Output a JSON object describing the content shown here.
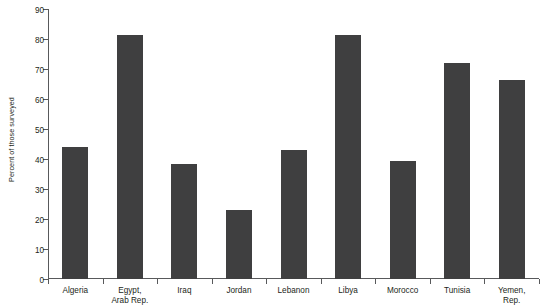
{
  "chart_data": {
    "type": "bar",
    "title": "",
    "subtitle": "",
    "xlabel": "",
    "ylabel": "Percent of those surveyed",
    "ylim": [
      0,
      90
    ],
    "ytick_step": 10,
    "yticks": [
      "90",
      "80",
      "70",
      "60",
      "50",
      "40",
      "30",
      "20",
      "10",
      "0"
    ],
    "ytick_values": [
      90,
      80,
      70,
      60,
      50,
      40,
      30,
      20,
      10,
      0
    ],
    "grid": false,
    "legend": null,
    "bar_color": "#3f3f40",
    "axis_color": "#58595b",
    "text_color": "#231f20",
    "background": "#ffffff",
    "categories": [
      "Algeria",
      "Egypt, Arab Rep.",
      "Iraq",
      "Jordan",
      "Lebanon",
      "Libya",
      "Morocco",
      "Tunisia",
      "Yemen, Rep."
    ],
    "category_lines": [
      [
        "Algeria"
      ],
      [
        "Egypt,",
        "Arab Rep."
      ],
      [
        "Iraq"
      ],
      [
        "Jordan"
      ],
      [
        "Lebanon"
      ],
      [
        "Libya"
      ],
      [
        "Morocco"
      ],
      [
        "Tunisia"
      ],
      [
        "Yemen,",
        "Rep."
      ]
    ],
    "values": [
      44,
      81.5,
      38.5,
      23,
      43,
      81.5,
      39.5,
      72,
      66.5
    ]
  }
}
